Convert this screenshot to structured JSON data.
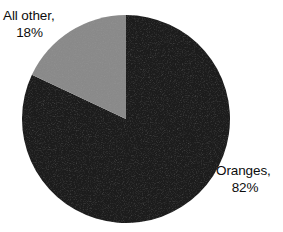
{
  "chart_data": {
    "type": "pie",
    "title": "",
    "subtitle": "",
    "xlabel": "",
    "ylabel": "",
    "grid": false,
    "legend_position": "none",
    "label_style": "outside-callout-text",
    "start_angle_deg": 0,
    "direction": "clockwise",
    "categories": [
      "Oranges",
      "All other"
    ],
    "values": [
      82,
      18
    ],
    "units": "percent",
    "colors": [
      "#1a1a1a",
      "#8a8a8a"
    ],
    "slices": [
      {
        "name": "Oranges",
        "value": 82,
        "value_text": "82%",
        "label_line_1": "Oranges,",
        "label_line_2": "82%",
        "color": "#1a1a1a",
        "sweep_deg": 295.2,
        "start_deg": 0,
        "end_deg": 295.2,
        "label_position": "right"
      },
      {
        "name": "All other",
        "value": 18,
        "value_text": "18%",
        "label_line_1": "All other,",
        "label_line_2": "18%",
        "color": "#8a8a8a",
        "sweep_deg": 64.8,
        "start_deg": 295.2,
        "end_deg": 360,
        "label_position": "top-left"
      }
    ],
    "annotations": []
  },
  "labels": {
    "all_other": {
      "line1": "All other,",
      "line2": "18%"
    },
    "oranges": {
      "line1": "Oranges,",
      "line2": "82%"
    }
  },
  "colors": {
    "background": "#ffffff",
    "text": "#0d0d0d",
    "slice_oranges": "#1a1a1a",
    "slice_all_other": "#8a8a8a"
  }
}
